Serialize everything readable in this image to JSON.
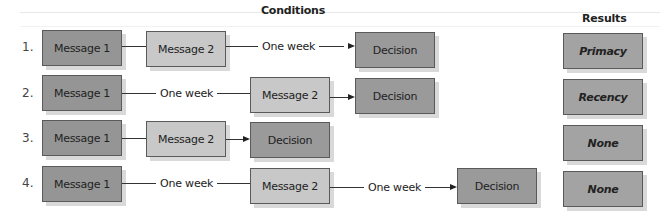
{
  "headings": {
    "conditions": "Conditions",
    "results": "Results"
  },
  "rows": [
    {
      "number": "1.",
      "steps": [
        "Message 1",
        "Message 2",
        "One week",
        "Decision"
      ],
      "result": "Primacy"
    },
    {
      "number": "2.",
      "steps": [
        "Message 1",
        "One week",
        "Message 2",
        "Decision"
      ],
      "result": "Recency"
    },
    {
      "number": "3.",
      "steps": [
        "Message 1",
        "Message 2",
        "Decision"
      ],
      "result": "None"
    },
    {
      "number": "4.",
      "steps": [
        "Message 1",
        "One week",
        "Message 2",
        "One week",
        "Decision"
      ],
      "result": "None"
    }
  ],
  "colors": {
    "message1_fill": "#959595",
    "message2_fill": "#c8c8c8",
    "decision_fill": "#9a9a9a",
    "result_fill": "#a3a3a3",
    "border": "#5a5a5a",
    "shadow": "#d9d9d9"
  }
}
